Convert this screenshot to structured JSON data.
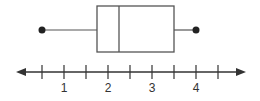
{
  "chart_data": {
    "type": "boxplot",
    "title": "",
    "xlabel": "",
    "ylabel": "",
    "orientation": "horizontal",
    "min": 0.5,
    "q1": 1.75,
    "median": 2.25,
    "q3": 3.5,
    "max": 4,
    "axis": {
      "range": [
        0.5,
        4.5
      ],
      "tick_step": 0.5,
      "ticks": [
        0.5,
        1,
        1.5,
        2,
        2.5,
        3,
        3.5,
        4,
        4.5
      ],
      "tick_labels": [
        "1",
        "2",
        "3",
        "4"
      ],
      "arrows_both_ends": true
    },
    "grid": false,
    "colors": {
      "stroke": "#555555",
      "dot": "#222222"
    }
  }
}
